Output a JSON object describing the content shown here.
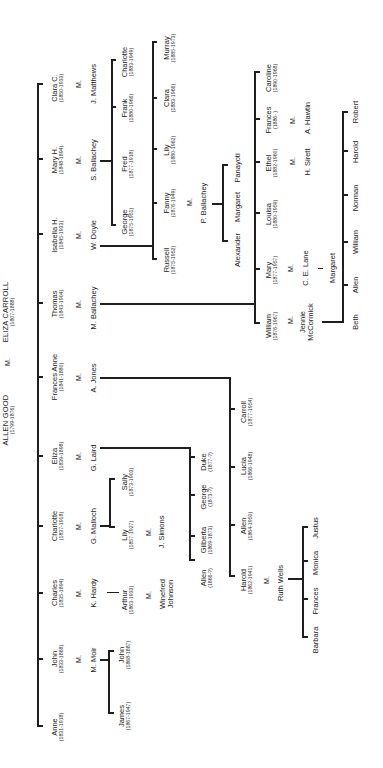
{
  "diagram": {
    "type": "family-tree",
    "orientation": "rotated-90-ccw",
    "root": {
      "father": {
        "name": "ALLEN GOOD",
        "dates": "(1799-1876)"
      },
      "marriage": "M.",
      "mother": {
        "name": "ELIZA CARROLL",
        "dates": "(1807-1888)"
      }
    },
    "children": [
      {
        "name": "Anne",
        "dates": "(1831-1918)"
      },
      {
        "name": "John",
        "dates": "(1833-1868)",
        "marriage": "M.",
        "spouse": "M. Moir",
        "children": [
          {
            "name": "James",
            "dates": "(1867-1947)"
          },
          {
            "name": "John",
            "dates": "(1868-1887)"
          }
        ]
      },
      {
        "name": "Charles",
        "dates": "(1835-1894)",
        "marriage": "M.",
        "spouse": "K. Hardy",
        "children": [
          {
            "name": "Arthur",
            "dates": "(1863-1933)",
            "marriage": "M.",
            "spouse": "Winefred Johnson"
          }
        ]
      },
      {
        "name": "Charlotte",
        "dates": "(1837-1918)",
        "marriage": "M.",
        "spouse": "G. Malloch",
        "children": [
          {
            "name": "Lily",
            "dates": "(1857-1927)",
            "marriage": "M.",
            "spouse": "J. Simons"
          },
          {
            "name": "Sally",
            "dates": "(1873-1903)"
          }
        ]
      },
      {
        "name": "Eliza",
        "dates": "(1839-1898)",
        "marriage": "M.",
        "spouse": "G. Laird",
        "children": [
          {
            "name": "Allen",
            "dates": "(1866-?)"
          },
          {
            "name": "Gilberta",
            "dates": "(1869-1873)"
          },
          {
            "name": "George",
            "dates": "(1873-?)"
          },
          {
            "name": "Duke",
            "dates": "(1877-?)"
          }
        ]
      },
      {
        "name": "Frances Anne",
        "dates": "(1841-1880)",
        "marriage": "M.",
        "spouse": "A. Jones",
        "children": [
          {
            "name": "Harold",
            "dates": "(1862-1941)",
            "marriage": "M.",
            "spouse": "Ruth Wells",
            "children": [
              {
                "name": "Barbara"
              },
              {
                "name": "Frances"
              },
              {
                "name": "Monica"
              },
              {
                "name": "Justus"
              }
            ]
          },
          {
            "name": "Allen",
            "dates": "(1864-1950)"
          },
          {
            "name": "Lucia",
            "dates": "(1866-1948)"
          },
          {
            "name": "Carroll",
            "dates": "(1877-1954)"
          }
        ]
      },
      {
        "name": "Thomas",
        "dates": "(1843-1904)",
        "marriage": "M.",
        "spouse": "M. Ballachey",
        "children": [
          {
            "name": "William",
            "dates": "(1876-1967)",
            "marriage": "M.",
            "spouse": "Jennie McCormick",
            "children": [
              {
                "name": "Beth"
              },
              {
                "name": "Allen"
              },
              {
                "name": "William"
              },
              {
                "name": "Norman"
              },
              {
                "name": "Harold"
              },
              {
                "name": "Robert"
              }
            ]
          },
          {
            "name": "Mary",
            "dates": "(1877-1957)",
            "marriage": "M.",
            "spouse": "C. E. Lane",
            "children": [
              {
                "name": "Margaret"
              }
            ]
          },
          {
            "name": "Louisa",
            "dates": "(1880-1959)"
          },
          {
            "name": "Ethel",
            "dates": "(1882-1960)",
            "marriage": "M.",
            "spouse": "H. Sirett"
          },
          {
            "name": "Frances",
            "dates": "(1886- )",
            "marriage": "M.",
            "spouse": "A. Hawtin"
          },
          {
            "name": "Caroline",
            "dates": "(1890-1968)"
          }
        ]
      },
      {
        "name": "Isabella H.",
        "dates": "(1845-1933)",
        "marriage": "M.",
        "spouse": "W. Doyle",
        "children": [
          {
            "name": "Russell",
            "dates": "(1875-1952)"
          },
          {
            "name": "Fanny",
            "dates": "(1876-1949)",
            "marriage": "M.",
            "spouse": "P. Ballachey",
            "children": [
              {
                "name": "Alexander"
              },
              {
                "name": "Margaret"
              },
              {
                "name": "Panayoti"
              }
            ]
          },
          {
            "name": "Lily",
            "dates": "(1880-1962)"
          },
          {
            "name": "Clara",
            "dates": "(1883-1966)"
          },
          {
            "name": "Murray",
            "dates": "(1885-1973)"
          }
        ]
      },
      {
        "name": "Mary H.",
        "dates": "(1848-1894)",
        "marriage": "M.",
        "spouse": "S. Ballachey",
        "children": [
          {
            "name": "George",
            "dates": "(1875-1951)"
          },
          {
            "name": "Fred",
            "dates": "(1877-1918)"
          },
          {
            "name": "Frank",
            "dates": "(1880-1966)"
          },
          {
            "name": "Charlotte",
            "dates": "(1883-1949)"
          }
        ]
      },
      {
        "name": "Clara C.",
        "dates": "(1850-1933)",
        "marriage": "M.",
        "spouse": "J. Matthews"
      }
    ]
  },
  "t": {
    "root_father": "ALLEN GOOD",
    "root_father_dates": "(1799-1876)",
    "root_m": "M.",
    "root_mother": "ELIZA CARROLL",
    "root_mother_dates": "(1807-1888)",
    "m": "M.",
    "anne": "Anne",
    "anne_d": "(1831-1918)",
    "john": "John",
    "john_d": "(1833-1868)",
    "mmoir": "M. Moir",
    "james": "James",
    "james_d": "(1867-1947)",
    "john2": "John",
    "john2_d": "(1868-1887)",
    "charles": "Charles",
    "charles_d": "(1835-1894)",
    "khardy": "K. Hardy",
    "arthur": "Arthur",
    "arthur_d": "(1863-1933)",
    "winefred1": "Winefred",
    "winefred2": "Johnson",
    "charlotte": "Charlotte",
    "charlotte_d": "(1837-1918)",
    "gmalloch": "G. Malloch",
    "lily": "Lily",
    "lily_d": "(1857-1927)",
    "jsimons": "J. Simons",
    "sally": "Sally",
    "sally_d": "(1873-1903)",
    "eliza": "Eliza",
    "eliza_d": "(1839-1898)",
    "glaird": "G. Laird",
    "allenL": "Allen",
    "allenL_d": "(1866-?)",
    "gilberta": "Gilberta",
    "gilberta_d": "(1869-1873)",
    "georgeL": "George",
    "georgeL_d": "(1873-?)",
    "duke": "Duke",
    "duke_d": "(1877-?)",
    "frances": "Frances Anne",
    "frances_d": "(1841-1880)",
    "ajones": "A. Jones",
    "harold": "Harold",
    "harold_d": "(1862-1941)",
    "ruthwells": "Ruth Wells",
    "barbara": "Barbara",
    "francesW": "Frances",
    "monica": "Monica",
    "justus": "Justus",
    "allenJ": "Allen",
    "allenJ_d": "(1864-1950)",
    "lucia": "Lucia",
    "lucia_d": "(1866-1948)",
    "carroll": "Carroll",
    "carroll_d": "(1877-1954)",
    "thomas": "Thomas",
    "thomas_d": "(1843-1904)",
    "mballachey": "M. Ballachey",
    "william": "William",
    "william_d": "(1876-1967)",
    "jennie1": "Jennie",
    "jennie2": "McCormick",
    "beth": "Beth",
    "allenM": "Allen",
    "williamM": "William",
    "norman": "Norman",
    "haroldM": "Harold",
    "robert": "Robert",
    "mary": "Mary",
    "mary_d": "(1877-1957)",
    "celane": "C. E. Lane",
    "margaretL": "Margaret",
    "louisa": "Louisa",
    "louisa_d": "(1880-1959)",
    "ethel": "Ethel",
    "ethel_d": "(1882-1960)",
    "hsirett": "H. Sirett",
    "francesB": "Frances",
    "francesB_d": "(1886- )",
    "ahawtin": "A. Hawtin",
    "caroline": "Caroline",
    "caroline_d": "(1890-1968)",
    "isabella": "Isabella H.",
    "isabella_d": "(1845-1933)",
    "wdoyle": "W. Doyle",
    "russell": "Russell",
    "russell_d": "(1875-1952)",
    "fanny": "Fanny",
    "fanny_d": "(1876-1949)",
    "pballachey": "P. Ballachey",
    "alexander": "Alexander",
    "margaretP": "Margaret",
    "panayoti": "Panayoti",
    "lilyD": "Lily",
    "lilyD_d": "(1880-1962)",
    "clara": "Clara",
    "clara_d": "(1883-1966)",
    "murray": "Murray",
    "murray_d": "(1885-1973)",
    "maryh": "Mary H.",
    "maryh_d": "(1848-1894)",
    "sballachey": "S. Ballachey",
    "georgeB": "George",
    "georgeB_d": "(1875-1951)",
    "fred": "Fred",
    "fred_d": "(1877-1918)",
    "frank": "Frank",
    "frank_d": "(1880-1966)",
    "charlotteB": "Charlotte",
    "charlotteB_d": "(1883-1949)",
    "clarac": "Clara C.",
    "clarac_d": "(1850-1933)",
    "jmatthews": "J. Matthews"
  }
}
